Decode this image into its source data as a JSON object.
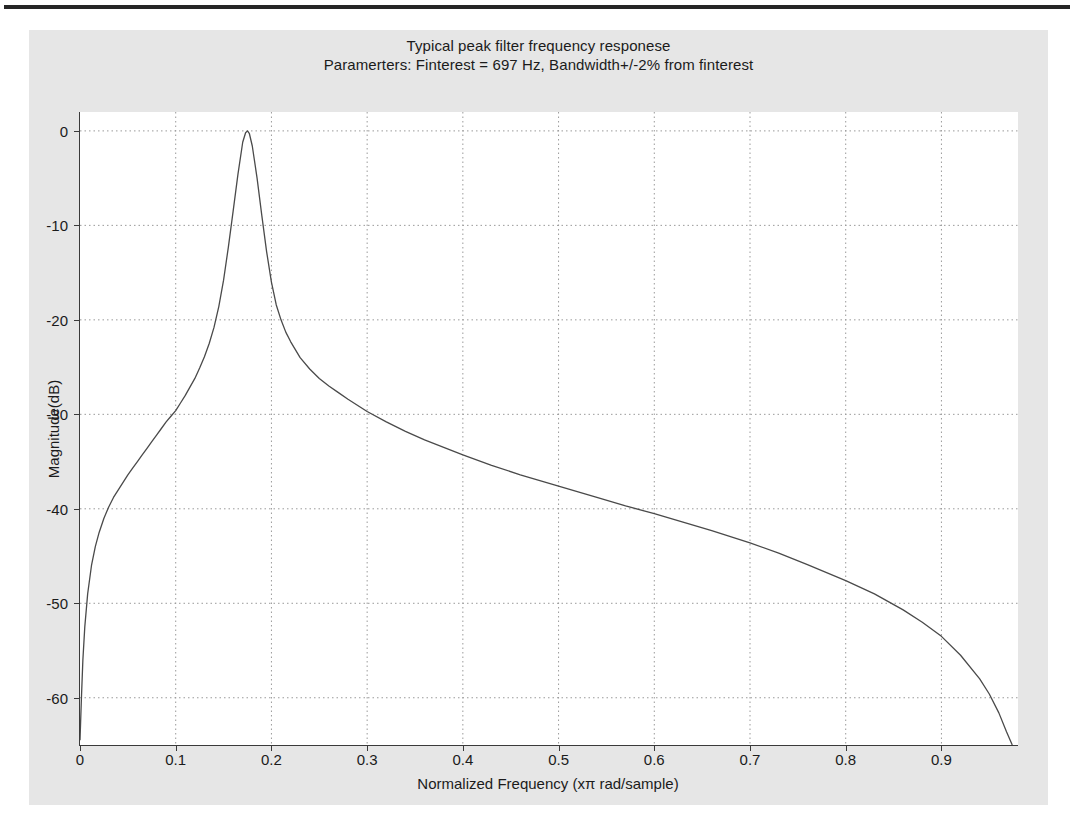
{
  "figure": {
    "title": "Typical peak filter frequency responese",
    "subtitle": "Paramerters: Finterest = 697 Hz, Bandwidth+/-2% from finterest",
    "background_color": "#e6e6e6",
    "axes_background_color": "#ffffff"
  },
  "chart_data": {
    "type": "line",
    "title": "Typical peak filter frequency responese",
    "subtitle": "Paramerters: Finterest = 697 Hz, Bandwidth+/-2% from finterest",
    "xlabel": "Normalized Frequency (xπ rad/sample)",
    "ylabel": "Magnitude(dB)",
    "xlim": [
      0,
      0.98
    ],
    "ylim": [
      -65,
      2
    ],
    "xticks": [
      0,
      0.1,
      0.2,
      0.3,
      0.4,
      0.5,
      0.6,
      0.7,
      0.8,
      0.9
    ],
    "xtick_labels": [
      "0",
      "0.1",
      "0.2",
      "0.3",
      "0.4",
      "0.5",
      "0.6",
      "0.7",
      "0.8",
      "0.9"
    ],
    "yticks": [
      0,
      -10,
      -20,
      -30,
      -40,
      -50,
      -60
    ],
    "ytick_labels": [
      "0",
      "-10",
      "-20",
      "-30",
      "-40",
      "-50",
      "-60"
    ],
    "grid": true,
    "grid_style": "dotted",
    "grid_color": "#9a9a9a",
    "line_color": "#4a4a4a",
    "legend": null,
    "annotations": [
      {
        "label": "peak",
        "x": 0.175,
        "y": 0.0
      },
      {
        "label": "finterest_hz",
        "value": 697
      },
      {
        "label": "bandwidth_percent",
        "value": 2
      }
    ],
    "series": [
      {
        "name": "Magnitude response",
        "x": [
          0.0,
          0.0015,
          0.003,
          0.005,
          0.008,
          0.012,
          0.016,
          0.02,
          0.025,
          0.03,
          0.035,
          0.04,
          0.045,
          0.05,
          0.055,
          0.06,
          0.065,
          0.07,
          0.075,
          0.08,
          0.085,
          0.09,
          0.095,
          0.1,
          0.105,
          0.11,
          0.115,
          0.12,
          0.125,
          0.13,
          0.135,
          0.14,
          0.145,
          0.15,
          0.155,
          0.16,
          0.165,
          0.17,
          0.173,
          0.175,
          0.177,
          0.18,
          0.185,
          0.19,
          0.195,
          0.2,
          0.205,
          0.21,
          0.215,
          0.22,
          0.23,
          0.24,
          0.25,
          0.26,
          0.27,
          0.28,
          0.3,
          0.32,
          0.34,
          0.36,
          0.38,
          0.4,
          0.43,
          0.46,
          0.5,
          0.54,
          0.57,
          0.6,
          0.63,
          0.66,
          0.7,
          0.73,
          0.76,
          0.8,
          0.83,
          0.86,
          0.88,
          0.9,
          0.92,
          0.94,
          0.95,
          0.96,
          0.968,
          0.974
        ],
        "y": [
          -64.5,
          -60.0,
          -56.0,
          -52.5,
          -49.0,
          -46.0,
          -44.0,
          -42.5,
          -41.0,
          -39.8,
          -38.8,
          -38.0,
          -37.2,
          -36.4,
          -35.7,
          -35.0,
          -34.3,
          -33.6,
          -32.9,
          -32.2,
          -31.5,
          -30.8,
          -30.2,
          -29.6,
          -28.8,
          -28.0,
          -27.1,
          -26.2,
          -25.1,
          -23.9,
          -22.5,
          -20.8,
          -18.6,
          -15.8,
          -12.3,
          -8.5,
          -4.6,
          -1.2,
          -0.2,
          0.0,
          -0.3,
          -1.6,
          -5.0,
          -9.0,
          -12.8,
          -16.0,
          -18.4,
          -20.0,
          -21.3,
          -22.3,
          -24.0,
          -25.2,
          -26.2,
          -27.0,
          -27.7,
          -28.4,
          -29.7,
          -30.8,
          -31.8,
          -32.7,
          -33.5,
          -34.3,
          -35.4,
          -36.4,
          -37.6,
          -38.8,
          -39.7,
          -40.5,
          -41.4,
          -42.3,
          -43.6,
          -44.7,
          -45.9,
          -47.6,
          -49.0,
          -50.7,
          -52.0,
          -53.5,
          -55.5,
          -58.0,
          -59.6,
          -61.6,
          -63.6,
          -65.0
        ]
      }
    ]
  },
  "axes": {
    "xlabel": "Normalized Frequency (xπ rad/sample)",
    "ylabel": "Magnitude(dB)"
  }
}
